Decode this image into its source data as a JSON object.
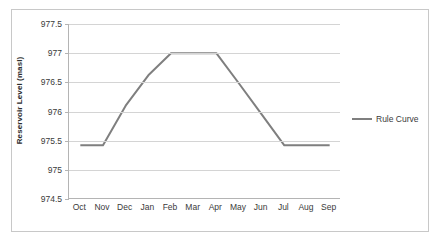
{
  "chart_data": {
    "type": "line",
    "title": "",
    "xlabel": "",
    "ylabel": "Reservoir Level (masl)",
    "categories": [
      "Oct",
      "Nov",
      "Dec",
      "Jan",
      "Feb",
      "Mar",
      "Apr",
      "May",
      "Jun",
      "Jul",
      "Aug",
      "Sep"
    ],
    "series": [
      {
        "name": "Rule Curve",
        "color": "#7f7f7f",
        "values": [
          975.42,
          975.42,
          976.1,
          976.62,
          977.0,
          977.0,
          977.0,
          976.48,
          975.95,
          975.42,
          975.42,
          975.42
        ]
      }
    ],
    "ylim": [
      974.5,
      977.5
    ],
    "yticks": [
      974.5,
      975,
      975.5,
      976,
      976.5,
      977,
      977.5
    ],
    "ytick_labels": [
      "974.5",
      "975",
      "975.5",
      "976",
      "976.5",
      "977",
      "977.5"
    ],
    "grid": true,
    "legend_position": "right",
    "legend_entries": [
      "Rule Curve"
    ],
    "gridline_color": "#d4d4d4",
    "axis_color": "#b4b4b4",
    "frame_color": "#c8c8c8"
  }
}
